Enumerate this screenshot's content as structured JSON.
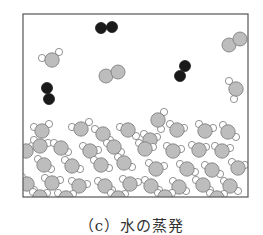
{
  "caption": "（c）水の蒸発",
  "colors": {
    "frame": "#555555",
    "oxygen": "#bdbdbd",
    "oxygen_stroke": "#777777",
    "nitrogen": "#1a1a1a",
    "hydrogen": "#ffffff",
    "hydrogen_stroke": "#777777"
  },
  "frame": {
    "x": 23,
    "y": 14,
    "w": 225,
    "h": 183
  },
  "gas": {
    "nitrogen": [
      [
        [
          101,
          28
        ],
        [
          112,
          27
        ]
      ],
      [
        [
          47,
          88
        ],
        [
          49,
          99
        ]
      ],
      [
        [
          185,
          66
        ],
        [
          180,
          76
        ]
      ]
    ],
    "oxygen": [
      [
        [
          106,
          76
        ],
        [
          118,
          72
        ]
      ],
      [
        [
          229,
          45
        ],
        [
          240,
          39
        ]
      ]
    ],
    "water": [
      [
        [
          52,
          60
        ],
        [
          42,
          58
        ],
        [
          59,
          52
        ]
      ],
      [
        [
          236,
          89
        ],
        [
          229,
          81
        ],
        [
          234,
          99
        ]
      ],
      [
        [
          158,
          120
        ],
        [
          164,
          112
        ],
        [
          161,
          129
        ]
      ]
    ]
  },
  "liquid_water": [
    [
      [
        42,
        131
      ],
      [
        34,
        127
      ],
      [
        49,
        124
      ]
    ],
    [
      [
        81,
        129
      ],
      [
        72,
        127
      ],
      [
        89,
        122
      ]
    ],
    [
      [
        103,
        134
      ],
      [
        95,
        129
      ],
      [
        110,
        140
      ]
    ],
    [
      [
        128,
        130
      ],
      [
        120,
        127
      ],
      [
        136,
        136
      ]
    ],
    [
      [
        150,
        140
      ],
      [
        144,
        134
      ],
      [
        157,
        137
      ]
    ],
    [
      [
        177,
        130
      ],
      [
        170,
        124
      ],
      [
        184,
        128
      ]
    ],
    [
      [
        205,
        131
      ],
      [
        199,
        124
      ],
      [
        213,
        128
      ]
    ],
    [
      [
        228,
        132
      ],
      [
        223,
        125
      ],
      [
        236,
        137
      ]
    ],
    [
      [
        26,
        151
      ],
      [
        19,
        147
      ],
      [
        32,
        146
      ]
    ],
    [
      [
        40,
        146
      ],
      [
        34,
        140
      ],
      [
        48,
        143
      ]
    ],
    [
      [
        61,
        148
      ],
      [
        54,
        143
      ],
      [
        68,
        152
      ]
    ],
    [
      [
        90,
        151
      ],
      [
        83,
        146
      ],
      [
        98,
        150
      ]
    ],
    [
      [
        114,
        147
      ],
      [
        107,
        143
      ],
      [
        121,
        152
      ]
    ],
    [
      [
        145,
        149
      ],
      [
        139,
        143
      ],
      [
        153,
        147
      ]
    ],
    [
      [
        173,
        151
      ],
      [
        167,
        146
      ],
      [
        181,
        149
      ]
    ],
    [
      [
        199,
        150
      ],
      [
        192,
        145
      ],
      [
        206,
        147
      ]
    ],
    [
      [
        222,
        151
      ],
      [
        215,
        146
      ],
      [
        230,
        148
      ]
    ],
    [
      [
        44,
        165
      ],
      [
        38,
        159
      ],
      [
        51,
        169
      ]
    ],
    [
      [
        72,
        166
      ],
      [
        65,
        160
      ],
      [
        80,
        169
      ]
    ],
    [
      [
        101,
        165
      ],
      [
        94,
        160
      ],
      [
        109,
        168
      ]
    ],
    [
      [
        124,
        163
      ],
      [
        118,
        157
      ],
      [
        132,
        167
      ]
    ],
    [
      [
        156,
        169
      ],
      [
        149,
        163
      ],
      [
        164,
        166
      ]
    ],
    [
      [
        187,
        169
      ],
      [
        180,
        164
      ],
      [
        195,
        172
      ]
    ],
    [
      [
        212,
        170
      ],
      [
        205,
        165
      ],
      [
        220,
        174
      ]
    ],
    [
      [
        238,
        168
      ],
      [
        232,
        162
      ],
      [
        245,
        165
      ]
    ],
    [
      [
        27,
        184
      ],
      [
        22,
        177
      ],
      [
        34,
        190
      ]
    ],
    [
      [
        52,
        183
      ],
      [
        45,
        178
      ],
      [
        60,
        180
      ]
    ],
    [
      [
        79,
        186
      ],
      [
        72,
        181
      ],
      [
        87,
        184
      ]
    ],
    [
      [
        105,
        186
      ],
      [
        98,
        181
      ],
      [
        112,
        190
      ]
    ],
    [
      [
        130,
        184
      ],
      [
        123,
        179
      ],
      [
        138,
        182
      ]
    ],
    [
      [
        151,
        186
      ],
      [
        145,
        180
      ],
      [
        159,
        190
      ]
    ],
    [
      [
        179,
        187
      ],
      [
        173,
        181
      ],
      [
        186,
        191
      ]
    ],
    [
      [
        203,
        185
      ],
      [
        196,
        180
      ],
      [
        210,
        190
      ]
    ],
    [
      [
        230,
        186
      ],
      [
        224,
        181
      ],
      [
        238,
        191
      ]
    ],
    [
      [
        40,
        197
      ],
      [
        33,
        192
      ],
      [
        47,
        193
      ]
    ],
    [
      [
        66,
        198
      ],
      [
        58,
        193
      ],
      [
        73,
        194
      ]
    ],
    [
      [
        118,
        198
      ],
      [
        111,
        193
      ],
      [
        125,
        194
      ]
    ],
    [
      [
        165,
        197
      ],
      [
        158,
        193
      ],
      [
        172,
        193
      ]
    ],
    [
      [
        217,
        198
      ],
      [
        210,
        193
      ],
      [
        224,
        194
      ]
    ]
  ]
}
